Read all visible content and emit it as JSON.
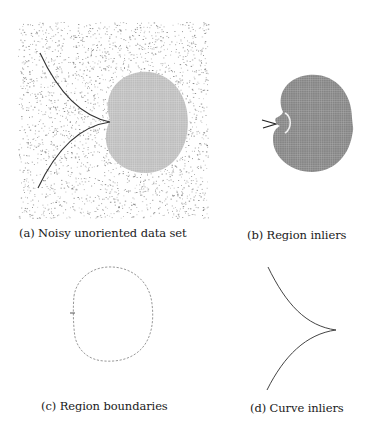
{
  "figure": {
    "subfigures": [
      {
        "id": "a",
        "caption": "(a) Noisy unoriented data set",
        "content": "noisy point cloud with a filled disc region and a cusp-shaped curve",
        "noise": {
          "x": 18,
          "y": 22,
          "width": 190,
          "height": 196,
          "count": 2600,
          "color": "#6e6e6e",
          "seed": 7
        },
        "region": {
          "cx": 146,
          "cy": 122,
          "rx": 42,
          "ry": 51,
          "fill": "#bdbdbd",
          "grid_color": "#e4e4e4"
        },
        "curve": {
          "top": [
            40,
            53
          ],
          "cusp": [
            110,
            122
          ],
          "bottom": [
            38,
            188
          ],
          "color": "#333333"
        }
      },
      {
        "id": "b",
        "caption": "(b) Region inliers",
        "content": "dense darker disc region with a small notch and short curve stub",
        "region": {
          "cx": 312,
          "cy": 123,
          "rx": 41,
          "ry": 49,
          "fill": "#8a8a8a",
          "grid_color": "#c8c8c8"
        },
        "notch": {
          "x": 283,
          "y": 123
        },
        "color": "#222222"
      },
      {
        "id": "c",
        "caption": "(c) Region boundaries",
        "content": "dotted outline of the disc region boundary",
        "boundary": {
          "cx": 113,
          "cy": 314,
          "rx": 40,
          "ry": 48,
          "color": "#8c8c8c"
        }
      },
      {
        "id": "d",
        "caption": "(d) Curve inliers",
        "content": "cusp-shaped curve only",
        "curve": {
          "top": [
            268,
            267
          ],
          "cusp": [
            336,
            330
          ],
          "bottom": [
            267,
            390
          ],
          "color": "#444444"
        }
      }
    ]
  }
}
